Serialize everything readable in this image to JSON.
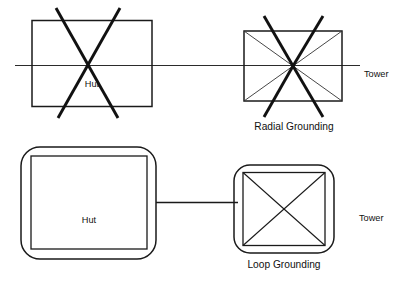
{
  "figure": {
    "kind": "grounding-comparison-diagram",
    "background_color": "#ffffff",
    "line_color": "#1a1a1a"
  },
  "top_row": {
    "hut": {
      "label": "Hut",
      "shape": "rectangle",
      "marking": "thick-x-overrun"
    },
    "tower": {
      "label": "Tower",
      "shape": "rectangle",
      "marking": "radial-spokes"
    },
    "caption": "Radial Grounding",
    "connector": "horizontal-line-through-both"
  },
  "bottom_row": {
    "hut": {
      "label": "Hut",
      "shape": "rounded-rectangle-with-inner-rectangle",
      "marking": "none"
    },
    "tower": {
      "label": "Tower",
      "shape": "rounded-rectangle-with-inner-rectangle",
      "marking": "thin-x-diagonals"
    },
    "caption": "Loop Grounding",
    "connector": "horizontal-line-between-boxes"
  }
}
